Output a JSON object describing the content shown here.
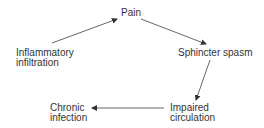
{
  "diagram": {
    "type": "cycle",
    "nodes": {
      "pain": {
        "line1": "Pain"
      },
      "inflammatory": {
        "line1": "Inflammatory",
        "line2": "infiltration"
      },
      "sphincter": {
        "line1": "Sphincter spasm"
      },
      "impaired": {
        "line1": "Impaired",
        "line2": "circulation"
      },
      "chronic": {
        "line1": "Chronic",
        "line2": "infection"
      }
    },
    "edges": [
      {
        "from": "Inflammatory infiltration",
        "to": "Pain"
      },
      {
        "from": "Pain",
        "to": "Sphincter spasm"
      },
      {
        "from": "Sphincter spasm",
        "to": "Impaired circulation"
      },
      {
        "from": "Impaired circulation",
        "to": "Chronic infection"
      }
    ],
    "colors": {
      "text": "#333333",
      "arrow": "#444444",
      "background": "#ffffff"
    }
  }
}
